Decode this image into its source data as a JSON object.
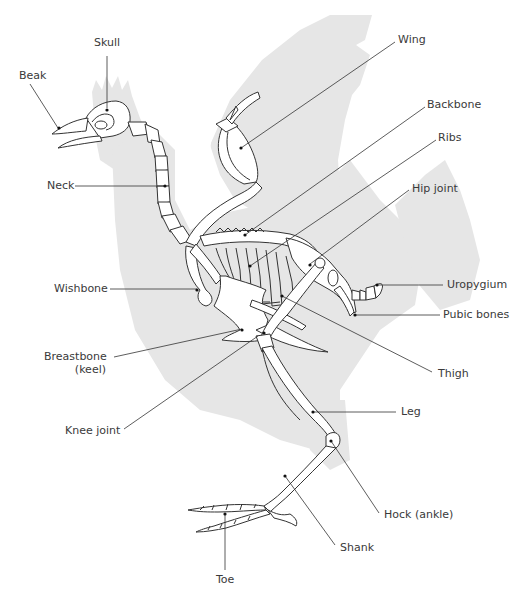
{
  "diagram": {
    "silhouette_color": "#e6e6e6",
    "line_color": "#333333",
    "labels": [
      {
        "id": "skull",
        "text": "Skull"
      },
      {
        "id": "beak",
        "text": "Beak"
      },
      {
        "id": "neck",
        "text": "Neck"
      },
      {
        "id": "wing",
        "text": "Wing"
      },
      {
        "id": "backbone",
        "text": "Backbone"
      },
      {
        "id": "ribs",
        "text": "Ribs"
      },
      {
        "id": "hip-joint",
        "text": "Hip joint"
      },
      {
        "id": "uropygium",
        "text": "Uropygium"
      },
      {
        "id": "pubic-bones",
        "text": "Pubic bones"
      },
      {
        "id": "wishbone",
        "text": "Wishbone"
      },
      {
        "id": "breastbone",
        "text": "Breastbone",
        "text2": "(keel)"
      },
      {
        "id": "thigh",
        "text": "Thigh"
      },
      {
        "id": "knee-joint",
        "text": "Knee joint"
      },
      {
        "id": "leg",
        "text": "Leg"
      },
      {
        "id": "hock",
        "text": "Hock (ankle)"
      },
      {
        "id": "shank",
        "text": "Shank"
      },
      {
        "id": "toe",
        "text": "Toe"
      }
    ]
  }
}
